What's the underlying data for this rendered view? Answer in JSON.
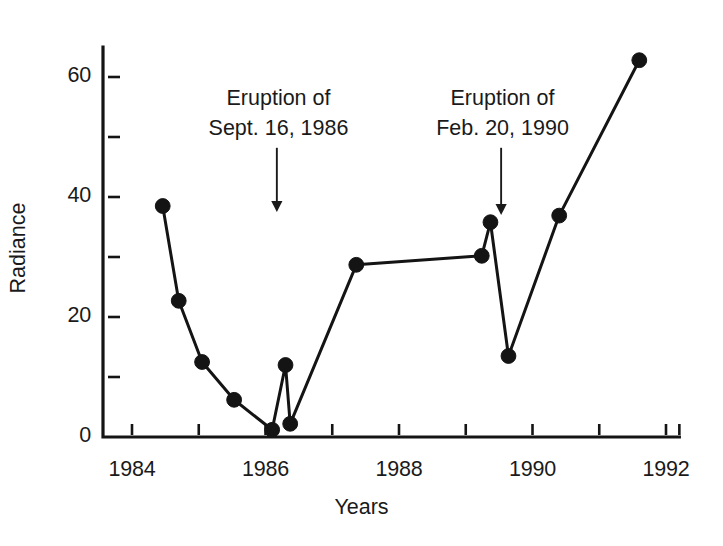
{
  "chart_data": {
    "type": "line",
    "title": "",
    "xlabel": "Years",
    "ylabel": "Radiance",
    "xlim": [
      1983.55,
      1992.2
    ],
    "ylim": [
      0,
      65
    ],
    "grid": false,
    "legend": null,
    "x_ticks_major": [
      1984,
      1986,
      1988,
      1990,
      1992
    ],
    "x_ticks_minor": [
      1985,
      1987,
      1989,
      1991
    ],
    "x_tick_labels": [
      "1984",
      "1986",
      "1988",
      "1990",
      "1992"
    ],
    "y_ticks_major": [
      0,
      20,
      40,
      60
    ],
    "y_ticks_minor": [
      10,
      30,
      50
    ],
    "y_tick_labels": [
      "0",
      "20",
      "40",
      "60"
    ],
    "series": [
      {
        "name": "Radiance",
        "marker": "filled-circle",
        "x": [
          1984.46,
          1984.7,
          1985.05,
          1985.53,
          1986.1,
          1986.3,
          1986.37,
          1987.36,
          1989.24,
          1989.37,
          1989.64,
          1990.4,
          1991.6
        ],
        "y": [
          38.5,
          22.7,
          12.5,
          6.2,
          1.2,
          12.0,
          2.2,
          28.7,
          30.2,
          35.8,
          13.5,
          36.9,
          62.8
        ]
      }
    ],
    "annotations": [
      {
        "id": "eruption-1",
        "line1": "Eruption of",
        "line2": "Sept. 16, 1986",
        "arrow_x": 1986.17,
        "arrow_from_y": 48.2,
        "arrow_to_y": 37.5
      },
      {
        "id": "eruption-2",
        "line1": "Eruption of",
        "line2": "Feb. 20, 1990",
        "arrow_x": 1989.53,
        "arrow_from_y": 48.2,
        "arrow_to_y": 37.0
      }
    ],
    "colors": {
      "line": "#141414",
      "marker": "#141414",
      "axis": "#141414",
      "text": "#1a1a1a",
      "background": "#ffffff"
    }
  }
}
